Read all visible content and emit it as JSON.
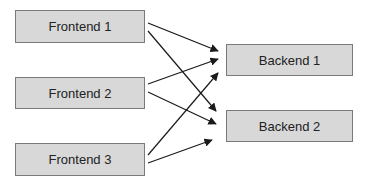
{
  "diagram": {
    "nodes": [
      {
        "id": "frontend-1",
        "label": "Frontend 1",
        "x": 15,
        "y": 10,
        "w": 130,
        "h": 33
      },
      {
        "id": "frontend-2",
        "label": "Frontend 2",
        "x": 15,
        "y": 77,
        "w": 130,
        "h": 32
      },
      {
        "id": "frontend-3",
        "label": "Frontend 3",
        "x": 15,
        "y": 143,
        "w": 130,
        "h": 33
      },
      {
        "id": "backend-1",
        "label": "Backend 1",
        "x": 226,
        "y": 44,
        "w": 127,
        "h": 32
      },
      {
        "id": "backend-2",
        "label": "Backend 2",
        "x": 226,
        "y": 110,
        "w": 127,
        "h": 32
      }
    ],
    "edges": [
      {
        "from": "frontend-1",
        "to": "backend-1",
        "x1": 148,
        "y1": 23,
        "x2": 218,
        "y2": 51
      },
      {
        "from": "frontend-1",
        "to": "backend-2",
        "x1": 148,
        "y1": 31,
        "x2": 216,
        "y2": 111
      },
      {
        "from": "frontend-2",
        "to": "backend-1",
        "x1": 148,
        "y1": 84,
        "x2": 218,
        "y2": 59
      },
      {
        "from": "frontend-2",
        "to": "backend-2",
        "x1": 148,
        "y1": 92,
        "x2": 216,
        "y2": 124
      },
      {
        "from": "frontend-3",
        "to": "backend-1",
        "x1": 148,
        "y1": 155,
        "x2": 218,
        "y2": 73
      },
      {
        "from": "frontend-3",
        "to": "backend-2",
        "x1": 148,
        "y1": 163,
        "x2": 212,
        "y2": 140
      }
    ],
    "colors": {
      "fill": "#d8d8d8",
      "border": "#7a7a7a",
      "text": "#222222",
      "edge": "#1a1a1a"
    }
  }
}
